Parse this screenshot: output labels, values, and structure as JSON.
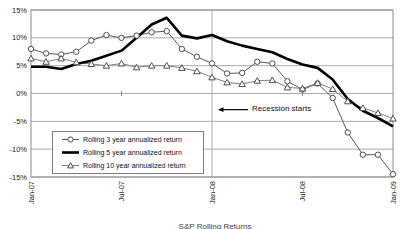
{
  "chart_data": {
    "type": "line",
    "title": "",
    "xlabel": "",
    "ylabel": "",
    "ylim": [
      -15,
      15
    ],
    "y_tick_labels": [
      "15%",
      "10%",
      "5%",
      "0%",
      "-5%",
      "-10%",
      "-15%"
    ],
    "y_tick_values": [
      15,
      10,
      5,
      0,
      -5,
      -10,
      -15
    ],
    "x_tick_labels": [
      "Jan-07",
      "Jul-07",
      "Jan-08",
      "Jul-08",
      "Jan-09"
    ],
    "x_tick_month_index": [
      0,
      6,
      12,
      18,
      24
    ],
    "categories": [
      "Jan-07",
      "Feb-07",
      "Mar-07",
      "Apr-07",
      "May-07",
      "Jun-07",
      "Jul-07",
      "Aug-07",
      "Sep-07",
      "Oct-07",
      "Nov-07",
      "Dec-07",
      "Jan-08",
      "Feb-08",
      "Mar-08",
      "Apr-08",
      "May-08",
      "Jun-08",
      "Jul-08",
      "Aug-08",
      "Sep-08",
      "Oct-08",
      "Nov-08",
      "Dec-08",
      "Jan-09"
    ],
    "series": [
      {
        "name": "Rolling 3 year annualized return",
        "marker": "circle",
        "line": "thin",
        "color": "#595959",
        "values": [
          8.0,
          7.2,
          7.0,
          7.5,
          9.5,
          10.5,
          10.0,
          10.4,
          11.0,
          11.2,
          8.0,
          6.6,
          5.4,
          3.6,
          3.7,
          5.7,
          5.4,
          2.2,
          0.7,
          1.8,
          -0.8,
          -7.0,
          -11.0,
          -11.0,
          -14.5
        ]
      },
      {
        "name": "Rolling 5 year annualized return",
        "marker": "none",
        "line": "thick",
        "color": "#000000",
        "values": [
          4.8,
          4.8,
          4.4,
          5.3,
          5.9,
          6.8,
          7.7,
          10.0,
          12.4,
          13.6,
          10.4,
          9.9,
          10.5,
          9.4,
          8.6,
          8.0,
          7.4,
          6.2,
          5.2,
          4.6,
          2.5,
          -1.0,
          -3.1,
          -4.4,
          -5.9
        ]
      },
      {
        "name": "Rolling 10 year annualized return",
        "marker": "triangle",
        "line": "thin",
        "color": "#7f7f7f",
        "values": [
          6.3,
          5.7,
          6.3,
          5.6,
          5.3,
          5.0,
          5.4,
          4.7,
          5.0,
          5.0,
          4.6,
          4.0,
          2.9,
          2.0,
          1.7,
          2.3,
          2.4,
          1.1,
          0.9,
          1.9,
          0.8,
          -1.4,
          -2.6,
          -3.5,
          -4.5
        ]
      }
    ],
    "annotation": {
      "text": "Recession starts",
      "points_to_category": "Jan-08",
      "y_value": -2.9,
      "arrow_direction": "left"
    },
    "grid": {
      "horizontal": true,
      "vertical_at_category": "Jan-08"
    },
    "legend_position": "inside-bottom-left",
    "caption": "S&P Rolling Returns",
    "colors": {
      "gridline": "#ababab",
      "border": "#8c8c8c",
      "marker_fill": "#ffffff",
      "marker_stroke": "#4d4d4d",
      "text": "#1a1a1a"
    }
  }
}
